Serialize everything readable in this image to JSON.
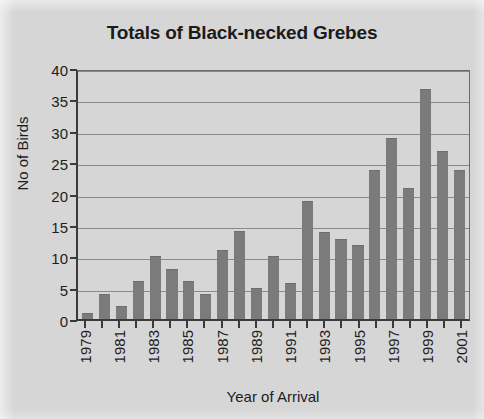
{
  "chart_data": {
    "type": "bar",
    "title": "Totals of Black-necked Grebes",
    "xlabel": "Year of Arrival",
    "ylabel": "No of Birds",
    "ylim": [
      0,
      40
    ],
    "ytick_step": 5,
    "yticks": [
      0,
      5,
      10,
      15,
      20,
      25,
      30,
      35,
      40
    ],
    "ytick_labels": [
      "0",
      "5",
      "10",
      "15",
      "20",
      "25",
      "30",
      "35",
      "40"
    ],
    "grid": true,
    "legend": false,
    "bar_color": "#7b7b7b",
    "plot_background": "#d6d6d6",
    "axis_color": "#3a3a3a",
    "categories": [
      "1979",
      "1980",
      "1981",
      "1982",
      "1983",
      "1984",
      "1985",
      "1986",
      "1987",
      "1988",
      "1989",
      "1990",
      "1991",
      "1992",
      "1993",
      "1994",
      "1995",
      "1996",
      "1997",
      "1998",
      "1999",
      "2000",
      "2001"
    ],
    "xtick_labels": [
      "1979",
      "",
      "1981",
      "",
      "1983",
      "",
      "1985",
      "",
      "1987",
      "",
      "1989",
      "",
      "1991",
      "",
      "1993",
      "",
      "1995",
      "",
      "1997",
      "",
      "1999",
      "",
      "2001"
    ],
    "values": [
      1,
      4,
      2,
      6,
      10,
      8,
      6,
      4,
      11,
      14,
      5,
      10,
      5.8,
      18.8,
      13.9,
      12.8,
      11.8,
      23.8,
      28.8,
      20.8,
      36.6,
      26.7,
      23.8
    ]
  }
}
